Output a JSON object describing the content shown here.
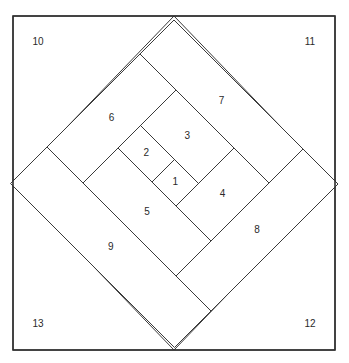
{
  "colors": {
    "line": "#3a3a3a",
    "background": "#ffffff"
  },
  "pieces": [
    {
      "label": "1",
      "a": [
        334,
        382
      ],
      "b": [
        -30,
        15
      ]
    },
    {
      "label": "2",
      "a": [
        266,
        334
      ],
      "b": [
        -30,
        15
      ]
    },
    {
      "label": "3",
      "a": [
        266,
        382
      ],
      "b": [
        15,
        86
      ]
    },
    {
      "label": "4",
      "a": [
        382,
        452
      ],
      "b": [
        -30,
        86
      ]
    },
    {
      "label": "5",
      "a": [
        266,
        452
      ],
      "b": [
        -100,
        -30
      ]
    },
    {
      "label": "6",
      "a": [
        194,
        266
      ],
      "b": [
        -100,
        86
      ]
    },
    {
      "label": "7",
      "a": [
        194,
        452
      ],
      "b": [
        86,
        154
      ]
    },
    {
      "label": "8",
      "a": [
        452,
        522
      ],
      "b": [
        -100,
        154
      ]
    },
    {
      "label": "9",
      "a": [
        194,
        522
      ],
      "b": [
        -173,
        -100
      ]
    }
  ],
  "corners": [
    {
      "label": "10",
      "corner": "top-left"
    },
    {
      "label": "11",
      "corner": "top-right"
    },
    {
      "label": "12",
      "corner": "bottom-right"
    },
    {
      "label": "13",
      "corner": "bottom-left"
    }
  ]
}
